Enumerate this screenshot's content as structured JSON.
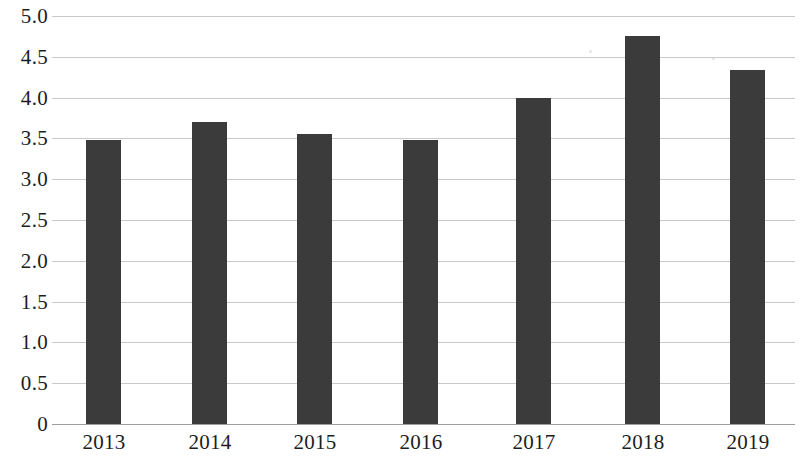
{
  "chart_data": {
    "type": "bar",
    "title": "",
    "subtitle": "",
    "xlabel": "",
    "ylabel": "",
    "categories": [
      "2013",
      "2014",
      "2015",
      "2016",
      "2017",
      "2018",
      "2019"
    ],
    "values": [
      3.48,
      3.7,
      3.56,
      3.48,
      3.99,
      4.75,
      4.34
    ],
    "series": [
      {
        "name": "",
        "values": [
          3.48,
          3.7,
          3.56,
          3.48,
          3.99,
          4.75,
          4.34
        ]
      }
    ],
    "ylim": [
      0,
      5.0
    ],
    "ytick_values": [
      5.0,
      4.5,
      4.0,
      3.5,
      3.0,
      2.5,
      2.0,
      1.5,
      1.0,
      0.5,
      0
    ],
    "ytick_labels": [
      "5.0",
      "4.5",
      "4.0",
      "3.5",
      "3.0",
      "2.5",
      "2.0",
      "1.5",
      "1.0",
      "0.5",
      "0"
    ],
    "grid": true,
    "grid_axis": "y",
    "legend": false,
    "legend_position": "none",
    "bar_color": "#3b3b3b",
    "gridline_color": "#c9c9c9",
    "axis_color": "#9d9d9d",
    "background_color": "#ffffff"
  }
}
